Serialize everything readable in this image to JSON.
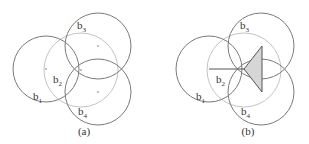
{
  "panels": [
    {
      "caption": "(a)",
      "labels": {
        "b1": {
          "base": "b",
          "sub": "1"
        },
        "b2": {
          "base": "b",
          "sub": "2"
        },
        "b3": {
          "base": "b",
          "sub": "3"
        },
        "b4": {
          "base": "b",
          "sub": "4"
        }
      }
    },
    {
      "caption": "(b)",
      "labels": {
        "b1": {
          "base": "b",
          "sub": "1"
        },
        "b2": {
          "base": "b",
          "sub": "2"
        },
        "b3": {
          "base": "b",
          "sub": "3"
        },
        "b4": {
          "base": "b",
          "sub": "4"
        }
      }
    }
  ],
  "colors": {
    "dark_circle": "#7a7a7a",
    "light_circle": "#c4c4c4",
    "line": "#555555",
    "triangle_fill": "#d6d6d6"
  }
}
